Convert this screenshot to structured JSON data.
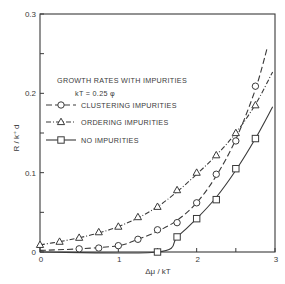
{
  "chart_data": {
    "type": "line",
    "title": "",
    "xlabel": "Δμ / kT",
    "ylabel": "R / k⁺ d",
    "xlim": [
      0,
      3
    ],
    "ylim": [
      0,
      0.3
    ],
    "x_ticks": [
      0,
      1,
      2,
      3
    ],
    "x_tick_labels": [
      "0",
      "1",
      "2",
      "3"
    ],
    "x_minor_ticks": [
      0.5,
      1.5,
      2.5
    ],
    "y_ticks": [
      0,
      0.1,
      0.2,
      0.3
    ],
    "y_tick_labels": [
      "0",
      "0.1",
      "0.2",
      "0.3"
    ],
    "y_minor_ticks": [
      0.05,
      0.15,
      0.25
    ],
    "grid": false,
    "legend": {
      "position": "upper-left",
      "title": "GROWTH RATES WITH IMPURITIES",
      "subtitle": "kT = 0.25 φ",
      "entries": [
        "CLUSTERING IMPURITIES",
        "ORDERING IMPURITIES",
        "NO IMPURITIES"
      ]
    },
    "series": [
      {
        "name": "CLUSTERING IMPURITIES",
        "marker": "circle",
        "line_style": "dashed",
        "x": [
          0.5,
          0.75,
          1.0,
          1.25,
          1.5,
          1.75,
          2.0,
          2.25,
          2.5,
          2.75
        ],
        "values": [
          0.004,
          0.005,
          0.008,
          0.016,
          0.028,
          0.037,
          0.062,
          0.098,
          0.14,
          0.209
        ],
        "curve_x": [
          0,
          0.5,
          1.0,
          1.25,
          1.5,
          1.75,
          2.0,
          2.25,
          2.5,
          2.75,
          2.9
        ],
        "curve_y": [
          0.002,
          0.004,
          0.008,
          0.016,
          0.026,
          0.04,
          0.062,
          0.096,
          0.142,
          0.205,
          0.257
        ]
      },
      {
        "name": "ORDERING IMPURITIES",
        "marker": "triangle",
        "line_style": "dash-dot",
        "x": [
          0,
          0.25,
          0.5,
          0.75,
          1.0,
          1.25,
          1.5,
          1.75,
          2.0,
          2.25,
          2.5,
          2.75
        ],
        "values": [
          0.009,
          0.013,
          0.018,
          0.025,
          0.032,
          0.044,
          0.057,
          0.078,
          0.1,
          0.122,
          0.15,
          0.185
        ],
        "curve_x": [
          0,
          0.25,
          0.5,
          0.75,
          1.0,
          1.25,
          1.5,
          1.75,
          2.0,
          2.25,
          2.5,
          2.75,
          2.97
        ],
        "curve_y": [
          0.009,
          0.013,
          0.018,
          0.024,
          0.032,
          0.043,
          0.057,
          0.076,
          0.098,
          0.122,
          0.15,
          0.186,
          0.227
        ]
      },
      {
        "name": "NO IMPURITIES",
        "marker": "square",
        "line_style": "solid",
        "x": [
          1.5,
          1.75,
          2.0,
          2.25,
          2.5,
          2.75
        ],
        "values": [
          0.0,
          0.019,
          0.042,
          0.066,
          0.105,
          0.143
        ],
        "curve_x": [
          0,
          1.5,
          1.75,
          2.0,
          2.25,
          2.5,
          2.75,
          2.97
        ],
        "curve_y": [
          0,
          0.0,
          0.019,
          0.042,
          0.069,
          0.103,
          0.143,
          0.183
        ]
      }
    ]
  },
  "colors": {
    "ink": "#3a3a3a",
    "background": "#ffffff"
  }
}
